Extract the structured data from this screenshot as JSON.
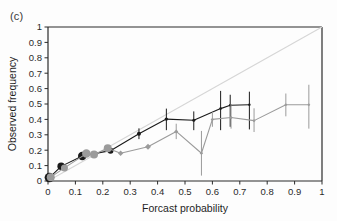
{
  "figure": {
    "panel_label": "(c)",
    "background_color": "#fdfdfd"
  },
  "chart_data": {
    "type": "line",
    "title": "",
    "subtitle": "",
    "xlabel": "Forcast probability",
    "ylabel": "Observed frequency",
    "xlim": [
      0,
      1
    ],
    "ylim": [
      0,
      1
    ],
    "xticks": [
      0,
      0.1,
      0.2,
      0.3,
      0.4,
      0.5,
      0.6,
      0.7,
      0.8,
      0.9,
      1
    ],
    "yticks": [
      0,
      0.1,
      0.2,
      0.3,
      0.4,
      0.5,
      0.6,
      0.7,
      0.8,
      0.9,
      1
    ],
    "xtick_labels": [
      "0",
      "0.1",
      "0.2",
      "0.3",
      "0.4",
      "0.5",
      "0.6",
      "0.7",
      "0.8",
      "0.9",
      "1"
    ],
    "ytick_labels": [
      "0",
      "0.1",
      "0.2",
      "0.3",
      "0.4",
      "0.5",
      "0.6",
      "0.7",
      "0.8",
      "0.9",
      "1"
    ],
    "grid": false,
    "legend": "none",
    "reference_line": {
      "name": "perfect-reliability-diagonal",
      "from": [
        0,
        0
      ],
      "to": [
        1,
        1
      ],
      "color": "#d6d6d6",
      "width": 1.1
    },
    "series": [
      {
        "name": "black-series",
        "color": "#1a1a1a",
        "marker": "circle",
        "x": [
          0.005,
          0.048,
          0.125,
          0.228,
          0.332,
          0.432,
          0.532,
          0.63,
          0.665,
          0.735
        ],
        "y": [
          0.022,
          0.095,
          0.163,
          0.197,
          0.307,
          0.402,
          0.394,
          0.47,
          0.492,
          0.495
        ],
        "err_low": [
          0.022,
          0.095,
          0.163,
          0.197,
          0.272,
          0.33,
          0.33,
          0.33,
          0.352,
          0.335
        ],
        "err_high": [
          0.022,
          0.095,
          0.163,
          0.197,
          0.342,
          0.47,
          0.452,
          0.585,
          0.56,
          0.58
        ],
        "marker_sizes": [
          9.5,
          7.5,
          8.5,
          6.0,
          4.0,
          3.4,
          3.0,
          2.6,
          2.6,
          2.4
        ]
      },
      {
        "name": "gray-series",
        "color": "#9b9b9b",
        "marker": "diamond",
        "x": [
          0.01,
          0.06,
          0.14,
          0.168,
          0.218,
          0.265,
          0.365,
          0.468,
          0.56,
          0.6,
          0.668,
          0.752,
          0.868,
          0.952
        ],
        "y": [
          0.025,
          0.085,
          0.178,
          0.172,
          0.213,
          0.18,
          0.222,
          0.322,
          0.18,
          0.4,
          0.412,
          0.392,
          0.495,
          0.495
        ],
        "err_low": [
          0.025,
          0.085,
          0.178,
          0.172,
          0.213,
          0.18,
          0.222,
          0.272,
          0.035,
          0.352,
          0.34,
          0.318,
          0.42,
          0.34
        ],
        "err_high": [
          0.025,
          0.085,
          0.178,
          0.172,
          0.213,
          0.18,
          0.222,
          0.372,
          0.325,
          0.448,
          0.5,
          0.472,
          0.568,
          0.625
        ],
        "marker_sizes": [
          8.0,
          7.0,
          8.5,
          8.0,
          8.0,
          4.0,
          4.4,
          3.0,
          2.6,
          2.6,
          2.4,
          2.4,
          2.2,
          2.2
        ]
      }
    ]
  }
}
